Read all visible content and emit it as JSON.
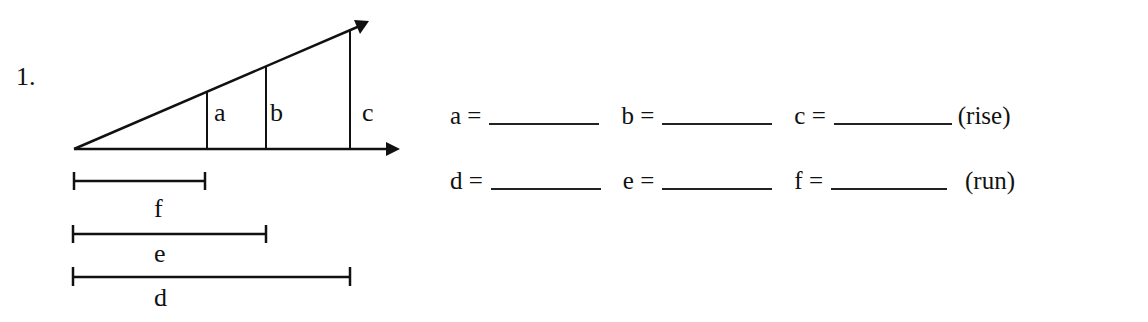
{
  "problem": {
    "number": "1."
  },
  "diagram": {
    "vertical_labels": [
      "a",
      "b",
      "c"
    ],
    "segment_labels": [
      "f",
      "e",
      "d"
    ],
    "line_color": "#111111"
  },
  "answers": {
    "rise_row": {
      "fields": [
        {
          "label": "a =",
          "value": ""
        },
        {
          "label": "b =",
          "value": ""
        },
        {
          "label": "c =",
          "value": ""
        }
      ],
      "tag": "(rise)"
    },
    "run_row": {
      "fields": [
        {
          "label": "d =",
          "value": ""
        },
        {
          "label": "e =",
          "value": ""
        },
        {
          "label": "f =",
          "value": ""
        }
      ],
      "tag": "(run)"
    }
  }
}
